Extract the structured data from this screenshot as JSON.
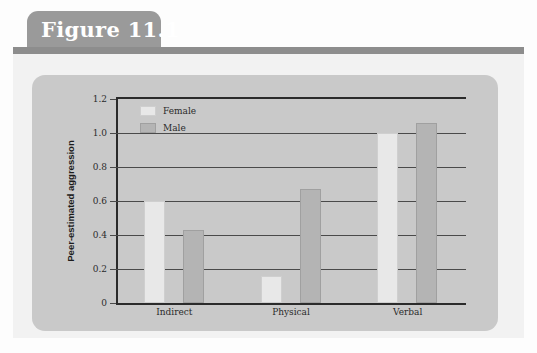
{
  "figure": {
    "tab_label": "Figure 11.1"
  },
  "chart_data": {
    "type": "bar",
    "title": "",
    "subtitle": "",
    "xlabel": "",
    "ylabel": "Peer-estimated aggression",
    "categories": [
      "Indirect",
      "Physical",
      "Verbal"
    ],
    "series": [
      {
        "name": "Female",
        "values": [
          0.6,
          0.16,
          1.0
        ],
        "color": "#e8e8e8"
      },
      {
        "name": "Male",
        "values": [
          0.43,
          0.67,
          1.06
        ],
        "color": "#b4b4b4"
      }
    ],
    "ylim": [
      0,
      1.2
    ],
    "ytick_labels": [
      "0",
      "0.2",
      "0.4",
      "0.6",
      "0.8",
      "1.0",
      "1.2"
    ],
    "ytick_values": [
      0,
      0.2,
      0.4,
      0.6,
      0.8,
      1.0,
      1.2
    ],
    "grid": true,
    "legend_position": "top-left",
    "legend_entries": [
      "Female",
      "Male"
    ]
  },
  "colors": {
    "tab_background": "#9a9a9a",
    "rule": "#8d8d8d",
    "card_background": "#c9c9c9",
    "page_background": "#f2f2f2",
    "axis": "#2b2b2b"
  }
}
